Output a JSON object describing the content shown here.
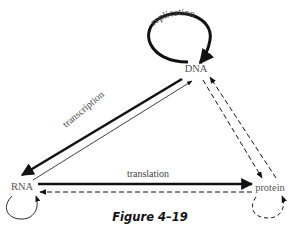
{
  "diagram": {
    "nodes": [
      {
        "id": "dna",
        "label": "DNA"
      },
      {
        "id": "rna",
        "label": "RNA"
      },
      {
        "id": "protein",
        "label": "protein"
      }
    ],
    "edges": [
      {
        "from": "dna",
        "to": "dna",
        "label": "replication",
        "style": "solid-thick"
      },
      {
        "from": "dna",
        "to": "rna",
        "label": "transcription",
        "style": "solid-thick"
      },
      {
        "from": "rna",
        "to": "dna",
        "label": "",
        "style": "solid-thin"
      },
      {
        "from": "rna",
        "to": "protein",
        "label": "translation",
        "style": "solid-thick"
      },
      {
        "from": "protein",
        "to": "rna",
        "label": "",
        "style": "dashed"
      },
      {
        "from": "dna",
        "to": "protein",
        "label": "",
        "style": "dashed"
      },
      {
        "from": "protein",
        "to": "dna",
        "label": "",
        "style": "dashed"
      },
      {
        "from": "rna",
        "to": "rna",
        "label": "",
        "style": "solid-thin"
      },
      {
        "from": "protein",
        "to": "protein",
        "label": "",
        "style": "dashed"
      }
    ],
    "caption": "Figure 4–19",
    "colors": {
      "line": "#111111",
      "text": "#555555",
      "background": "#ffffff"
    }
  }
}
